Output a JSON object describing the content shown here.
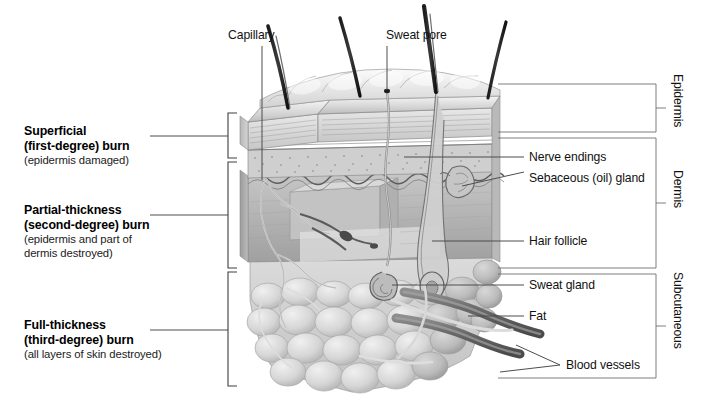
{
  "figure": {
    "background_color": "#ffffff",
    "ink_color": "#111111",
    "rule_color": "#6b6b6b"
  },
  "burn_depths": [
    {
      "id": "superficial",
      "title_line1": "Superficial",
      "title_line2": "(first-degree) burn",
      "detail": "(epidermis damaged)"
    },
    {
      "id": "partial-thickness",
      "title_line1": "Partial-thickness",
      "title_line2": "(second-degree) burn",
      "detail_line1": "(epidermis and part of",
      "detail_line2": "dermis destroyed)"
    },
    {
      "id": "full-thickness",
      "title_line1": "Full-thickness",
      "title_line2": "(third-degree) burn",
      "detail": "(all layers of skin destroyed)"
    }
  ],
  "structures": {
    "capillary": "Capillary",
    "sweat_pore": "Sweat pore",
    "nerve_endings": "Nerve endings",
    "sebaceous_gland": "Sebaceous (oil) gland",
    "hair_follicle": "Hair follicle",
    "sweat_gland": "Sweat gland",
    "fat": "Fat",
    "blood_vessels": "Blood vessels"
  },
  "skin_layers": [
    {
      "id": "epidermis",
      "label": "Epidermis"
    },
    {
      "id": "dermis",
      "label": "Dermis"
    },
    {
      "id": "subcutaneous",
      "label": "Subcutaneous"
    }
  ]
}
